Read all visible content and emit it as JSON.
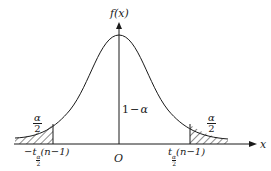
{
  "diagram": {
    "y_axis_label": "f(x)",
    "x_axis_label": "x",
    "origin_label": "O",
    "center_area_label": "1−α",
    "left_tail": {
      "area_num": "α",
      "area_den": "2",
      "critical_prefix": "−t",
      "critical_sub_num": "α",
      "critical_sub_den": "2",
      "critical_suffix": "(n−1)"
    },
    "right_tail": {
      "area_num": "α",
      "area_den": "2",
      "critical_prefix": "t",
      "critical_sub_num": "α",
      "critical_sub_den": "2",
      "critical_suffix": "(n−1)"
    },
    "colors": {
      "ink": "#1a1a1a",
      "background": "#ffffff"
    }
  }
}
